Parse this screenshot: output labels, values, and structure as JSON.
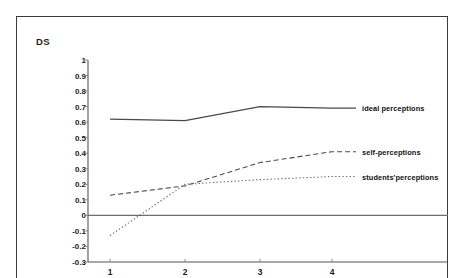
{
  "chart_data": {
    "type": "line",
    "title": "",
    "xlabel": "",
    "ylabel": "DS",
    "categories": [
      "1",
      "2",
      "3",
      "4"
    ],
    "x": [
      1,
      2,
      3,
      4
    ],
    "ylim": [
      -0.3,
      1
    ],
    "ytick_labels": [
      "1",
      "0.9",
      "0.8",
      "0.7",
      "0.6",
      "0.5",
      "0.4",
      "0.3",
      "0.2",
      "0.1",
      "0",
      "-0.1",
      "-0.2",
      "-0.3"
    ],
    "ytick_values": [
      1,
      0.9,
      0.8,
      0.7,
      0.6,
      0.5,
      0.4,
      0.3,
      0.2,
      0.1,
      0,
      -0.1,
      -0.2,
      -0.3
    ],
    "grid": false,
    "legend_position": "right-inline",
    "zero_line": true,
    "series": [
      {
        "name": "ideal perceptions",
        "style": "solid",
        "color": "#4a4a4a",
        "values": [
          0.62,
          0.61,
          0.7,
          0.69
        ]
      },
      {
        "name": "self-perceptions",
        "style": "dashed",
        "color": "#4a4a4a",
        "values": [
          0.13,
          0.19,
          0.34,
          0.41
        ]
      },
      {
        "name": "students'perceptions",
        "style": "dotted",
        "color": "#6b6b6b",
        "values": [
          -0.13,
          0.2,
          0.23,
          0.25
        ]
      }
    ]
  },
  "labels": {
    "ylabel": "DS",
    "series_0": "ideal perceptions",
    "series_1": "self-perceptions",
    "series_2": "students'perceptions",
    "x_0": "1",
    "x_1": "2",
    "x_2": "3",
    "x_3": "4",
    "y_0": "1",
    "y_1": "0.9",
    "y_2": "0.8",
    "y_3": "0.7",
    "y_4": "0.6",
    "y_5": "0.5",
    "y_6": "0.4",
    "y_7": "0.3",
    "y_8": "0.2",
    "y_9": "0.1",
    "y_10": "0",
    "y_11": "-0.1",
    "y_12": "-0.2",
    "y_13": "-0.3"
  }
}
